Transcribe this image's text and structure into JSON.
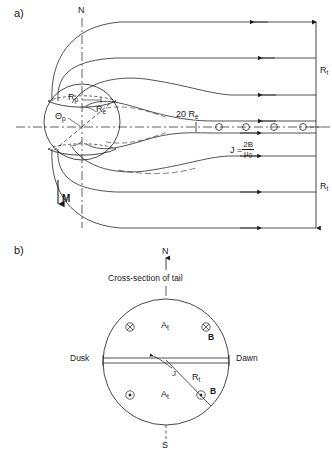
{
  "figure": {
    "panels": [
      {
        "id": "a",
        "label": "a)",
        "title": "Noon-midnight meridian cross-section of the magnetosphere",
        "annotations": {
          "north_axis": "N",
          "polar_cap_radius": "R",
          "polar_cap_radius_sub": "p",
          "polar_cap_angle": "Θ",
          "polar_cap_angle_sub": "p",
          "earth_radius": "R",
          "earth_radius_sub": "e",
          "magnetic_moment": "M",
          "distance_tick": "20 R",
          "distance_tick_sub": "e",
          "current_label": "J =",
          "current_numerator": "2B",
          "current_denominator": "μ",
          "current_denominator_sub": "0",
          "tail_radius_north": "R",
          "tail_radius_north_sub": "t",
          "tail_radius_south": "R",
          "tail_radius_south_sub": "t"
        }
      },
      {
        "id": "b",
        "label": "b)",
        "title": "Cross-section of tail",
        "annotations": {
          "north": "N",
          "south": "S",
          "caption": "Cross-section of tail",
          "dusk": "Dusk",
          "dawn": "Dawn",
          "current_sheet": "J",
          "tail_radius": "R",
          "tail_radius_sub": "t",
          "vector_potential_north": "A",
          "vector_potential_north_sub": "t",
          "vector_potential_south": "A",
          "vector_potential_south_sub": "t",
          "field_north": "B",
          "field_south": "B",
          "field_into_page_symbol": "⊗",
          "field_out_of_page_symbol": "⊙"
        }
      }
    ],
    "colors": {
      "line": "#1a1a1a",
      "background": "#ffffff"
    }
  }
}
